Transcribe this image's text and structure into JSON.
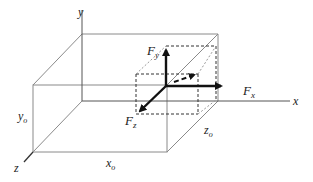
{
  "diagram": {
    "type": "3d-force-decomposition",
    "axes": {
      "x": "x",
      "y": "y",
      "z": "z"
    },
    "dimensions": {
      "x": "x",
      "x_sub": "o",
      "y": "y",
      "y_sub": "o",
      "z": "z",
      "z_sub": "o"
    },
    "forces": {
      "fx": {
        "main": "F",
        "sub": "x"
      },
      "fy": {
        "main": "F",
        "sub": "y"
      },
      "fz": {
        "main": "F",
        "sub": "z"
      }
    },
    "colors": {
      "box_line": "#8a8a8a",
      "axis_line": "#555555",
      "force_arrow": "#111111",
      "dashed": "#333333"
    }
  }
}
